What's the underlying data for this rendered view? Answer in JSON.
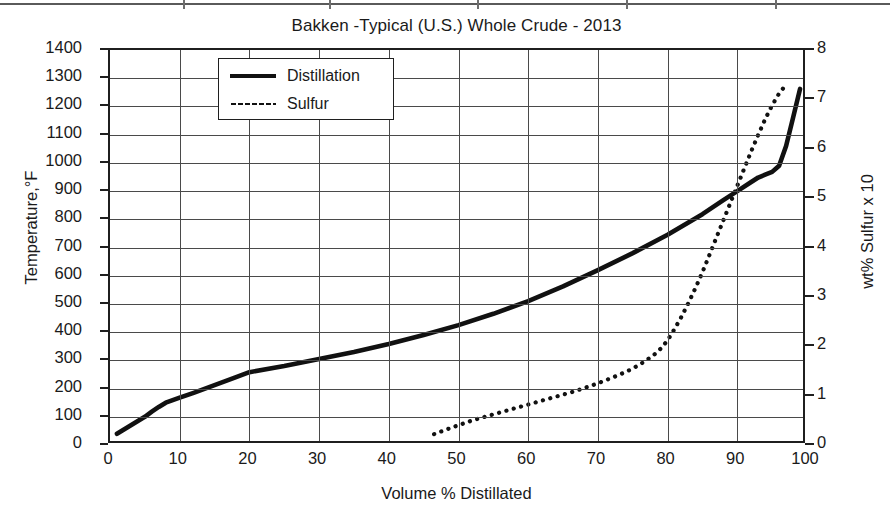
{
  "chart_data": {
    "type": "line",
    "title": "Bakken -Typical (U.S.) Whole Crude - 2013",
    "xlabel": "Volume % Distillated",
    "ylabel": "Temperature,°F",
    "ylabel_right": "wt% Sulfur x 10",
    "xlim": [
      0,
      100
    ],
    "ylim": [
      0,
      1400
    ],
    "ylim_right": [
      0,
      8
    ],
    "grid": true,
    "legend_position": "top-left-inside",
    "xticks": [
      0,
      10,
      20,
      30,
      40,
      50,
      60,
      70,
      80,
      90,
      100
    ],
    "yticks": [
      0,
      100,
      200,
      300,
      400,
      500,
      600,
      700,
      800,
      900,
      1000,
      1100,
      1200,
      1300,
      1400
    ],
    "yticks_right": [
      0,
      1,
      2,
      3,
      4,
      5,
      6,
      7,
      8
    ],
    "series": [
      {
        "name": "Distillation",
        "axis": "left",
        "style": "solid",
        "color": "#111111",
        "x": [
          1,
          2,
          3,
          4,
          5,
          6,
          7,
          8,
          10,
          12,
          15,
          18,
          20,
          25,
          30,
          35,
          40,
          45,
          50,
          55,
          60,
          65,
          70,
          75,
          80,
          85,
          88,
          90,
          92,
          93,
          94,
          95,
          96,
          97,
          98,
          99
        ],
        "y": [
          40,
          55,
          70,
          85,
          100,
          118,
          135,
          150,
          168,
          185,
          212,
          240,
          258,
          280,
          305,
          330,
          358,
          390,
          425,
          465,
          510,
          562,
          620,
          680,
          745,
          818,
          868,
          900,
          932,
          948,
          958,
          968,
          990,
          1060,
          1160,
          1262
        ]
      },
      {
        "name": "Sulfur",
        "axis": "right",
        "style": "dotted",
        "color": "#111111",
        "x": [
          46.5,
          48,
          50,
          52,
          54,
          56,
          58,
          60,
          62,
          64,
          66,
          68,
          70,
          72,
          74,
          75,
          76,
          77,
          78,
          79,
          80,
          81,
          82,
          83,
          84,
          85,
          86,
          87,
          88,
          89,
          90,
          91,
          92,
          93,
          94,
          95,
          96,
          97
        ],
        "y": [
          0.22,
          0.3,
          0.4,
          0.5,
          0.58,
          0.66,
          0.74,
          0.82,
          0.9,
          0.98,
          1.06,
          1.15,
          1.25,
          1.36,
          1.48,
          1.55,
          1.63,
          1.72,
          1.82,
          1.95,
          2.12,
          2.35,
          2.6,
          2.88,
          3.18,
          3.5,
          3.85,
          4.2,
          4.55,
          4.9,
          5.25,
          5.6,
          5.95,
          6.28,
          6.6,
          6.88,
          7.12,
          7.3
        ]
      }
    ]
  },
  "legend": {
    "items": [
      {
        "label": "Distillation",
        "style": "solid"
      },
      {
        "label": "Sulfur",
        "style": "dotted"
      }
    ]
  }
}
